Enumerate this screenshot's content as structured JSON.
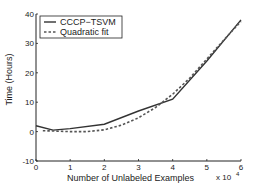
{
  "chart_data": {
    "type": "line",
    "title": "",
    "xlabel": "Number of Unlabeled Examples",
    "ylabel": "Time (Hours)",
    "x_multiplier": "x 10^4",
    "xlim": [
      0,
      6
    ],
    "ylim": [
      -10,
      40
    ],
    "xticks": [
      0,
      1,
      2,
      3,
      4,
      5,
      6
    ],
    "yticks": [
      -10,
      0,
      10,
      20,
      30,
      40
    ],
    "grid": false,
    "legend_position": "upper left",
    "series": [
      {
        "name": "CCCP−TSVM",
        "style": "solid",
        "x": [
          0,
          0.5,
          1,
          2,
          3,
          4,
          5,
          6
        ],
        "y": [
          2,
          0.5,
          1,
          2.5,
          7,
          11,
          24,
          38
        ]
      },
      {
        "name": "Quadratic fit",
        "style": "dashed",
        "x": [
          0.2,
          0.5,
          1,
          1.5,
          2,
          2.5,
          3,
          3.5,
          4,
          4.5,
          5,
          5.5,
          6
        ],
        "y": [
          0.3,
          0.2,
          0,
          0,
          0.6,
          2.2,
          4.7,
          8.2,
          12.7,
          18.2,
          24.7,
          31.2,
          37.5
        ]
      }
    ]
  },
  "labels": {
    "x_exponent_base": "x 10",
    "x_exponent_power": "4"
  }
}
